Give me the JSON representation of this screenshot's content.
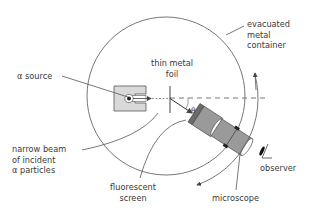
{
  "diagram": {
    "colors": {
      "line": "#555555",
      "fill_light": "#d9d9d9",
      "fill_mid": "#9a9a9a",
      "fill_dark": "#6a6a6a",
      "text": "#3a3a3a"
    },
    "labels": {
      "container": [
        "evacuated",
        "metal",
        "container"
      ],
      "foil": [
        "thin metal",
        "foil"
      ],
      "source": "α source",
      "beam": [
        "narrow beam",
        "of incident",
        "α particles"
      ],
      "screen": [
        "fluorescent",
        "screen"
      ],
      "microscope": "microscope",
      "observer": "observer",
      "angle": "θ"
    },
    "icons": {
      "eye": "observer-eye-icon"
    }
  }
}
